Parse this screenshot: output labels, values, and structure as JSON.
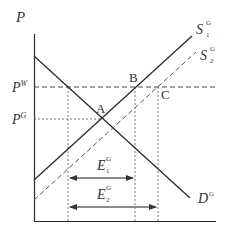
{
  "diagram": {
    "type": "supply-demand",
    "axes": {
      "y_label": "P",
      "x_label": ""
    },
    "price_levels": {
      "world": {
        "base": "P",
        "sup": "W"
      },
      "domestic": {
        "base": "P",
        "sup": "G"
      }
    },
    "curves": {
      "supply_1": {
        "base": "S",
        "sub": "1",
        "sup": "G",
        "style": "solid"
      },
      "supply_2": {
        "base": "S",
        "sub": "2",
        "sup": "G",
        "style": "dashed"
      },
      "demand": {
        "base": "D",
        "sup": "G",
        "style": "solid"
      }
    },
    "points": {
      "a": "A",
      "b": "B",
      "c": "C"
    },
    "exports": {
      "e1": {
        "base": "E",
        "sub": "1",
        "sup": "G"
      },
      "e2": {
        "base": "E",
        "sub": "2",
        "sup": "G"
      }
    },
    "colors": {
      "line": "#2a2a2a",
      "dashed": "#555555",
      "arrow": "#666666"
    }
  }
}
